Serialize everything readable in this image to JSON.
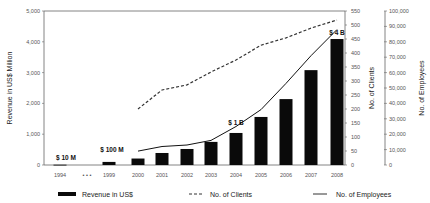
{
  "chart_data": {
    "type": "bar",
    "title": "",
    "categories": [
      "1994",
      "...",
      "1999",
      "2000",
      "2001",
      "2002",
      "2003",
      "2004",
      "2005",
      "2006",
      "2007",
      "2008"
    ],
    "series": [
      {
        "name": "Revenue in US$",
        "type": "bar",
        "axis": "left",
        "unit": "US$ Million",
        "values": [
          10,
          null,
          100,
          210,
          390,
          520,
          750,
          1040,
          1560,
          2140,
          3080,
          4090
        ]
      },
      {
        "name": "No. of Clients",
        "type": "line",
        "style": "dashed",
        "axis": "right1",
        "values": [
          null,
          null,
          null,
          200,
          268,
          286,
          332,
          375,
          428,
          454,
          489,
          518
        ]
      },
      {
        "name": "No. of Employees",
        "type": "line",
        "style": "solid",
        "axis": "right2",
        "values": [
          null,
          null,
          null,
          9000,
          12000,
          13000,
          16000,
          25000,
          36000,
          53000,
          71000,
          88000
        ]
      }
    ],
    "axes": {
      "left": {
        "label": "Revenue in US$ Million",
        "range": [
          0,
          5000
        ],
        "ticks": [
          "0",
          "1,000",
          "2,000",
          "3,000",
          "4,000",
          "5,000"
        ]
      },
      "right1": {
        "label": "No. of Clients",
        "range": [
          0,
          550
        ],
        "ticks": [
          "0",
          "50",
          "100",
          "150",
          "200",
          "250",
          "300",
          "350",
          "400",
          "450",
          "500",
          "550"
        ]
      },
      "right2": {
        "label": "No. of Employees",
        "range": [
          0,
          100000
        ],
        "ticks": [
          "0",
          "10,000",
          "20,000",
          "30,000",
          "40,000",
          "50,000",
          "60,000",
          "70,000",
          "80,000",
          "90,000",
          "100,000"
        ]
      }
    },
    "annotations": [
      {
        "text": "$ 10 M",
        "category": "1994"
      },
      {
        "text": "$ 100 M",
        "category": "1999"
      },
      {
        "text": "$ 1 B",
        "category": "2004"
      },
      {
        "text": "$ 4 B",
        "category": "2008"
      }
    ],
    "x_break_marker": "• • •",
    "legend": {
      "position": "bottom",
      "entries": [
        "Revenue in US$",
        "No. of Clients",
        "No. of Employees"
      ]
    },
    "grid": false
  }
}
